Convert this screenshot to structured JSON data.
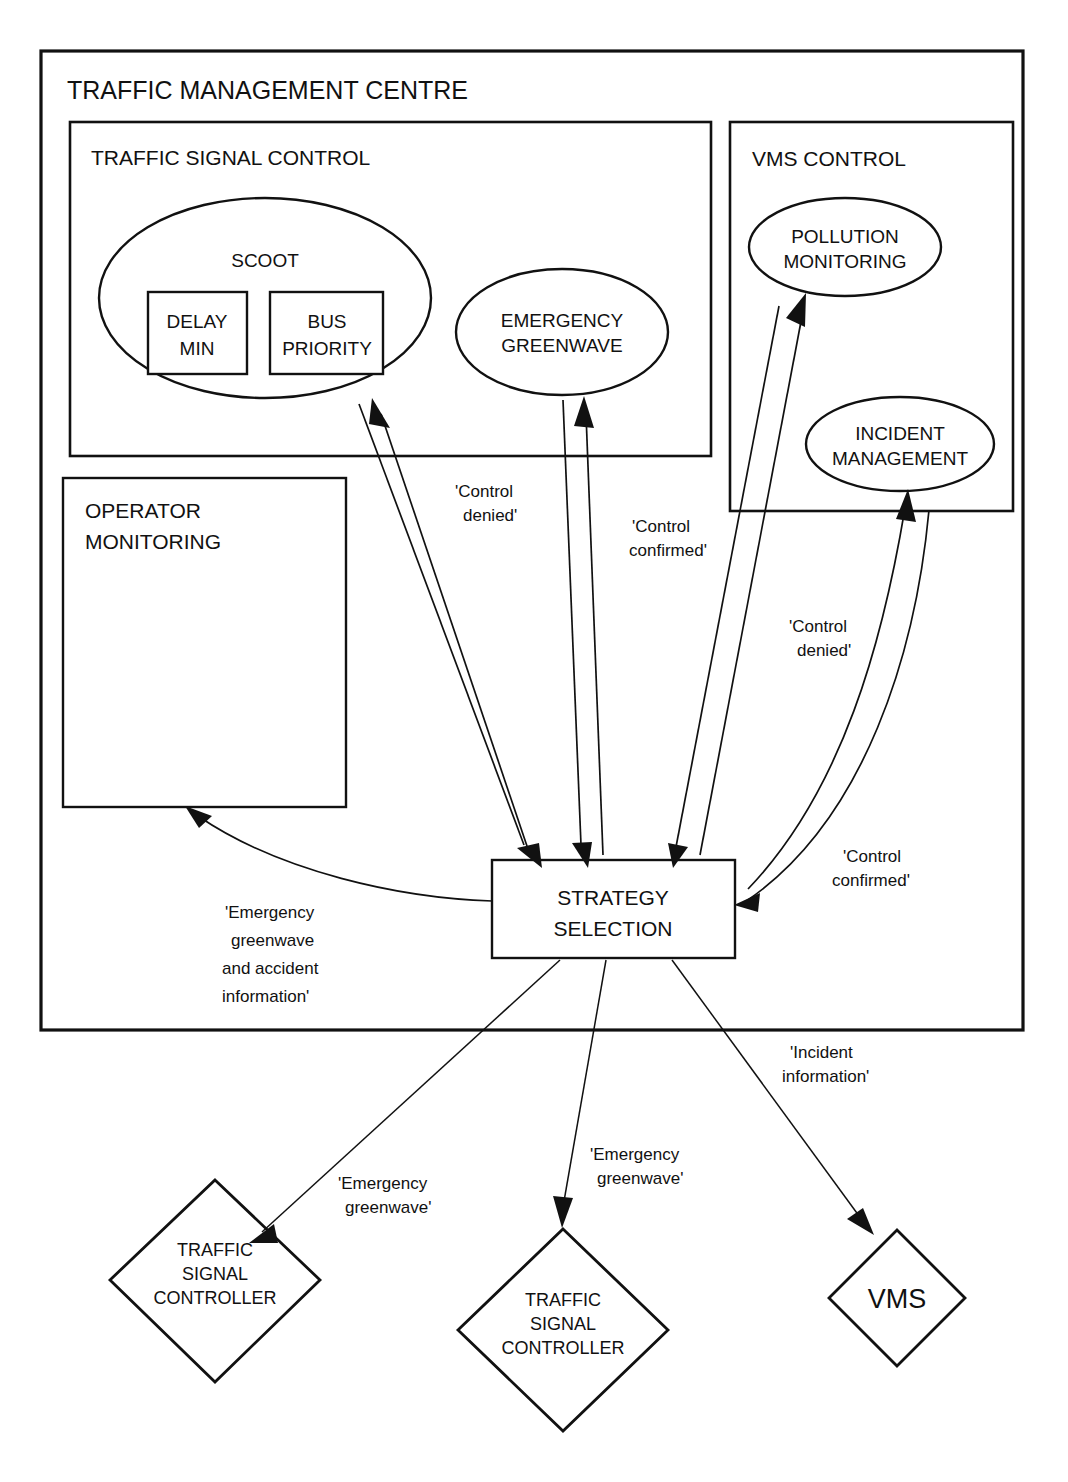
{
  "diagram": {
    "title": "TRAFFIC MANAGEMENT CENTRE",
    "sections": {
      "traffic_signal_control": "TRAFFIC SIGNAL CONTROL",
      "vms_control": "VMS CONTROL"
    },
    "nodes": {
      "scoot": "SCOOT",
      "delay_min_line1": "DELAY",
      "delay_min_line2": "MIN",
      "bus_priority_line1": "BUS",
      "bus_priority_line2": "PRIORITY",
      "emergency_greenwave_line1": "EMERGENCY",
      "emergency_greenwave_line2": "GREENWAVE",
      "pollution_monitoring_line1": "POLLUTION",
      "pollution_monitoring_line2": "MONITORING",
      "incident_management_line1": "INCIDENT",
      "incident_management_line2": "MANAGEMENT",
      "operator_monitoring_line1": "OPERATOR",
      "operator_monitoring_line2": "MONITORING",
      "strategy_selection_line1": "STRATEGY",
      "strategy_selection_line2": "SELECTION",
      "traffic_signal_controller_1_line1": "TRAFFIC",
      "traffic_signal_controller_1_line2": "SIGNAL",
      "traffic_signal_controller_1_line3": "CONTROLLER",
      "traffic_signal_controller_2_line1": "TRAFFIC",
      "traffic_signal_controller_2_line2": "SIGNAL",
      "traffic_signal_controller_2_line3": "CONTROLLER",
      "vms": "VMS"
    },
    "edge_labels": {
      "control_denied_scoot_line1": "'Control",
      "control_denied_scoot_line2": "denied'",
      "control_confirmed_greenwave_line1": "'Control",
      "control_confirmed_greenwave_line2": "confirmed'",
      "control_denied_vms_line1": "'Control",
      "control_denied_vms_line2": "denied'",
      "control_confirmed_vms_line1": "'Control",
      "control_confirmed_vms_line2": "confirmed'",
      "operator_info_line1": "'Emergency",
      "operator_info_line2": "greenwave",
      "operator_info_line3": "and accident",
      "operator_info_line4": "information'",
      "emergency_greenwave_left_line1": "'Emergency",
      "emergency_greenwave_left_line2": "greenwave'",
      "emergency_greenwave_mid_line1": "'Emergency",
      "emergency_greenwave_mid_line2": "greenwave'",
      "incident_information_line1": "'Incident",
      "incident_information_line2": "information'"
    },
    "colors": {
      "stroke": "#111111",
      "fill": "#ffffff",
      "background": "#ffffff"
    }
  }
}
